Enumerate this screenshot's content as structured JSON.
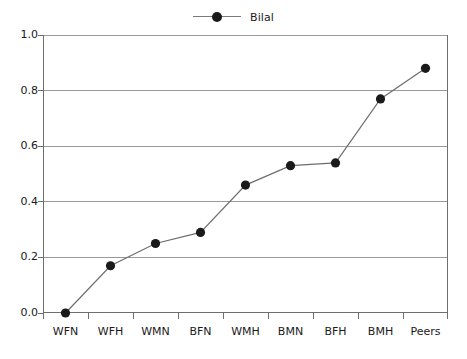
{
  "chart_data": {
    "type": "line",
    "title": "",
    "subtitle": "",
    "xlabel": "",
    "ylabel": "",
    "categories": [
      "WFN",
      "WFH",
      "WMN",
      "BFN",
      "WMH",
      "BMN",
      "BFH",
      "BMH",
      "Peers"
    ],
    "series": [
      {
        "name": "Bilal",
        "values": [
          0.0,
          0.17,
          0.25,
          0.29,
          0.46,
          0.53,
          0.54,
          0.77,
          0.88
        ],
        "marker": "filled-circle",
        "marker_color": "#1a1a1a",
        "line_color": "#6e6e6e"
      }
    ],
    "ylim": [
      0.0,
      1.0
    ],
    "y_ticks": [
      "0.0",
      "0.2",
      "0.4",
      "0.6",
      "0.8",
      "1.0"
    ],
    "y_tick_values": [
      0.0,
      0.2,
      0.4,
      0.6,
      0.8,
      1.0
    ],
    "grid": "horizontal",
    "grid_color": "#9a9a9a",
    "legend_position": "top-center",
    "legend_entries": [
      "Bilal"
    ],
    "frame_color": "#6e6e6e",
    "background": "#ffffff"
  },
  "legend": {
    "entries": [
      {
        "label": "Bilal"
      }
    ]
  },
  "axes": {
    "y": {
      "ticks": [
        "0.0",
        "0.2",
        "0.4",
        "0.6",
        "0.8",
        "1.0"
      ]
    },
    "x": {
      "ticks": [
        "WFN",
        "WFH",
        "WMN",
        "BFN",
        "WMH",
        "BMN",
        "BFH",
        "BMH",
        "Peers"
      ]
    }
  }
}
